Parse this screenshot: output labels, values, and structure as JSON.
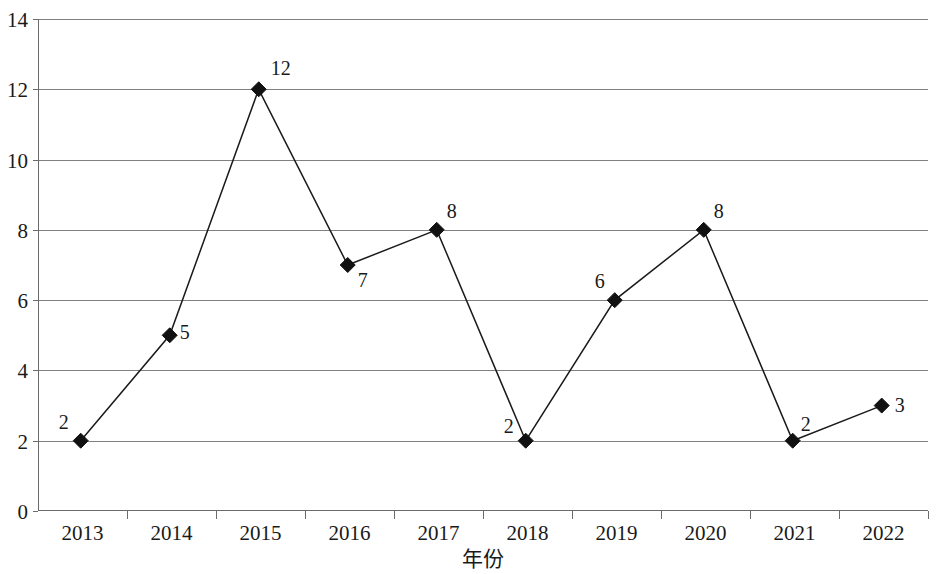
{
  "chart_data": {
    "type": "line",
    "title": "",
    "subtitle": "",
    "xlabel": "年份",
    "ylabel": "",
    "categories": [
      "2013",
      "2014",
      "2015",
      "2016",
      "2017",
      "2018",
      "2019",
      "2020",
      "2021",
      "2022"
    ],
    "values": [
      2,
      5,
      12,
      7,
      8,
      2,
      6,
      8,
      2,
      3
    ],
    "point_labels": [
      "2",
      "5",
      "12",
      "7",
      "8",
      "2",
      "6",
      "8",
      "2",
      "3"
    ],
    "ylim": [
      0,
      14
    ],
    "y_ticks": [
      "0",
      "2",
      "4",
      "6",
      "8",
      "10",
      "12",
      "14"
    ],
    "y_tick_values": [
      0,
      2,
      4,
      6,
      8,
      10,
      12,
      14
    ],
    "grid": true,
    "grid_axis": "y",
    "legend": "none",
    "marker": "diamond",
    "marker_color": "#111111",
    "line_color": "#1a1a1a",
    "grid_color": "#808080",
    "background_color": "#ffffff",
    "label_offsets": [
      {
        "dx": -12,
        "dy": -12,
        "anchor": "end"
      },
      {
        "dx": 10,
        "dy": 4,
        "anchor": "start"
      },
      {
        "dx": 12,
        "dy": -14,
        "anchor": "start"
      },
      {
        "dx": 10,
        "dy": 22,
        "anchor": "start"
      },
      {
        "dx": 10,
        "dy": -12,
        "anchor": "start"
      },
      {
        "dx": -12,
        "dy": -8,
        "anchor": "end"
      },
      {
        "dx": -10,
        "dy": -12,
        "anchor": "end"
      },
      {
        "dx": 10,
        "dy": -12,
        "anchor": "start"
      },
      {
        "dx": 8,
        "dy": -10,
        "anchor": "start"
      },
      {
        "dx": 13,
        "dy": 6,
        "anchor": "start"
      }
    ]
  },
  "axis": {
    "x_title": "年份"
  }
}
